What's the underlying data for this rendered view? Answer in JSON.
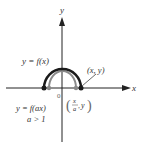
{
  "diagram": {
    "type": "function-transformation-graph",
    "axes": {
      "x_label": "x",
      "y_label": "y",
      "origin_label": "0"
    },
    "curves": [
      {
        "name": "original",
        "label": "y = f(x)",
        "color": "#1a1a1a",
        "point_label": "(x, y)"
      },
      {
        "name": "compressed",
        "label": "y = f(ax)",
        "condition": "a > 1",
        "color": "#888888",
        "point_label_num": "x",
        "point_label_den": "a",
        "point_label_y": "y"
      }
    ],
    "colors": {
      "axis": "#222222",
      "original_curve": "#1a1a1a",
      "transformed_curve": "#8a8a8a",
      "text": "#333333",
      "text_gray": "#666666"
    }
  }
}
